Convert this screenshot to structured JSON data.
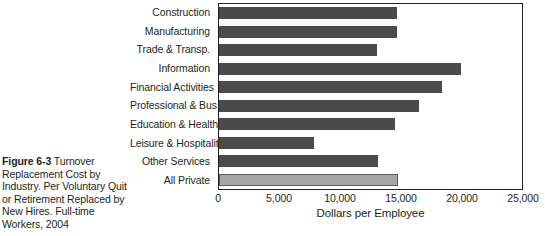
{
  "caption": {
    "figure_label": "Figure 6-3",
    "text": " Turnover Replacement Cost by Industry. Per Voluntary Quit or Retirement Replaced by New Hires. Full-time Workers, 2004"
  },
  "chart_data": {
    "type": "bar",
    "orientation": "horizontal",
    "title": "",
    "xlabel": "Dollars per Employee",
    "ylabel": "",
    "xlim": [
      0,
      25000
    ],
    "xticks": [
      0,
      5000,
      10000,
      15000,
      20000,
      25000
    ],
    "xtick_labels": [
      "0",
      "5,000",
      "10,000",
      "15,000",
      "20,000",
      "25,000"
    ],
    "grid": false,
    "legend": "none",
    "categories": [
      "Construction",
      "Manufacturing",
      "Trade & Transp.",
      "Information",
      "Financial Activities",
      "Professional & Bus.",
      "Education & Health",
      "Leisure & Hospitality",
      "Other Services",
      "All Private"
    ],
    "values": [
      14700,
      14700,
      13000,
      20000,
      18400,
      16500,
      14500,
      7800,
      13100,
      14800
    ],
    "bar_colors": [
      "#4a4a4a",
      "#4a4a4a",
      "#4a4a4a",
      "#4a4a4a",
      "#4a4a4a",
      "#4a4a4a",
      "#4a4a4a",
      "#4a4a4a",
      "#4a4a4a",
      "#a6a6a6"
    ],
    "highlight_index": 9,
    "highlight_color": "#a6a6a6",
    "series_color": "#4a4a4a"
  }
}
